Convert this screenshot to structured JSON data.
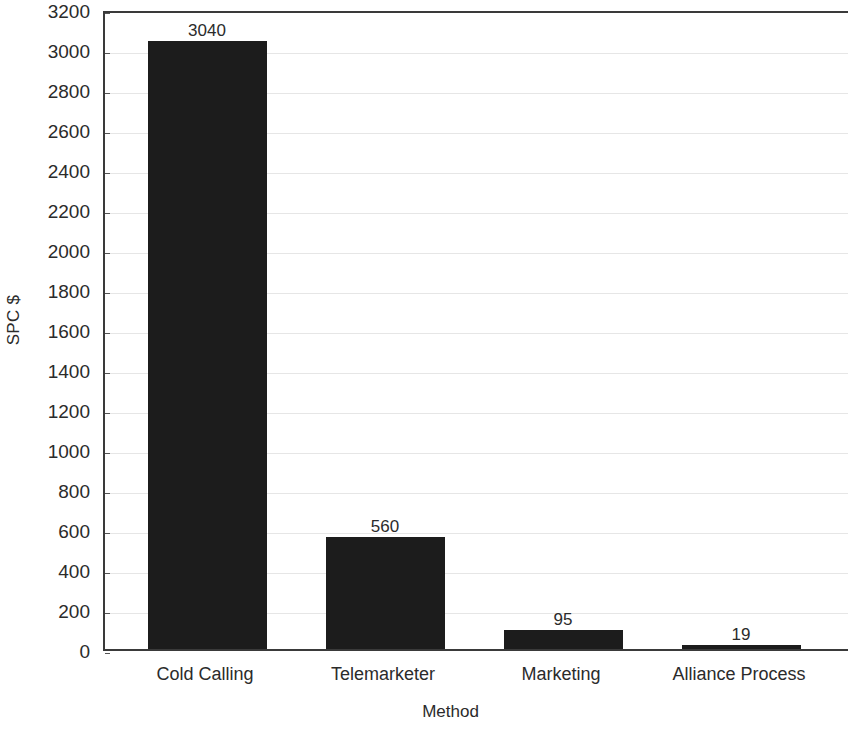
{
  "chart_data": {
    "type": "bar",
    "title": "",
    "xlabel": "Method",
    "ylabel": "SPC $",
    "categories": [
      "Cold Calling",
      "Telemarketer",
      "Marketing",
      "Alliance Process"
    ],
    "values": [
      3040,
      560,
      95,
      19
    ],
    "value_labels": [
      "3040",
      "560",
      "95",
      "19"
    ],
    "ylim": [
      0,
      3200
    ],
    "ytick_step": 200,
    "ytick_labels": [
      "0",
      "200",
      "400",
      "600",
      "800",
      "1000",
      "1200",
      "1400",
      "1600",
      "1800",
      "2000",
      "2200",
      "2400",
      "2600",
      "2800",
      "3000",
      "3200"
    ],
    "grid": true,
    "grid_axis": "y",
    "legend": false,
    "legend_position": "none",
    "series": [
      {
        "name": "SPC $",
        "values": [
          3040,
          560,
          95,
          19
        ]
      }
    ],
    "colors": {
      "bar": "#1c1c1c",
      "axis": "#3a3a3a",
      "grid": "#e6e6e6",
      "text": "#2b2b2b",
      "background": "#ffffff"
    }
  }
}
